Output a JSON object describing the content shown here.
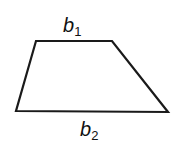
{
  "diagram": {
    "shape": "trapezoid",
    "vertices": [
      [
        36,
        41
      ],
      [
        112,
        41
      ],
      [
        168,
        112
      ],
      [
        16,
        111
      ]
    ],
    "stroke_color": "#1a1a1a",
    "labels": {
      "top_base": {
        "main": "b",
        "sub": "1"
      },
      "bottom_base": {
        "main": "b",
        "sub": "2"
      }
    }
  }
}
